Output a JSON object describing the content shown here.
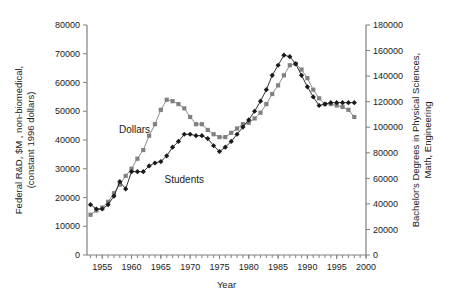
{
  "figure": {
    "background": "#ffffff",
    "axis_color": "#808080",
    "text_color": "#1a1a1a"
  },
  "axes": {
    "x": {
      "label": "Year",
      "ticks": [
        "1955",
        "1960",
        "1965",
        "1970",
        "1975",
        "1980",
        "1985",
        "1990",
        "1995",
        "2000"
      ],
      "tick_values": [
        1955,
        1960,
        1965,
        1970,
        1975,
        1980,
        1985,
        1990,
        1995,
        2000
      ],
      "min": 1952.4,
      "max": 2000,
      "minor_step": 1
    },
    "left": {
      "label_line1": "Federal R&D, $M , non-biomedical,",
      "label_line2": "(constant 1996 dollars)",
      "ticks": [
        "0",
        "10000",
        "20000",
        "30000",
        "40000",
        "50000",
        "60000",
        "70000",
        "80000"
      ],
      "tick_values": [
        0,
        10000,
        20000,
        30000,
        40000,
        50000,
        60000,
        70000,
        80000
      ],
      "min": 0,
      "max": 80000
    },
    "right": {
      "label_line1": "Bachelor's Degrees in Physical Sciences,",
      "label_line2": "Math, Engineering",
      "ticks": [
        "0",
        "20000",
        "40000",
        "60000",
        "80000",
        "100000",
        "120000",
        "140000",
        "160000",
        "180000"
      ],
      "tick_values": [
        0,
        20000,
        40000,
        60000,
        80000,
        100000,
        120000,
        140000,
        160000,
        180000
      ],
      "min": 0,
      "max": 180000
    }
  },
  "series_labels": {
    "dollars": "Dollars",
    "students": "Students"
  },
  "chart_data": {
    "type": "line",
    "title": "",
    "xlabel": "Year",
    "ylabel": "Federal R&D, $M , non-biomedical, (constant 1996 dollars)",
    "y2label": "Bachelor's Degrees in Physical Sciences, Math, Engineering",
    "xlim": [
      1952.4,
      2000
    ],
    "ylim": [
      0,
      80000
    ],
    "y2lim": [
      0,
      180000
    ],
    "grid": false,
    "legend": "inline-annotations",
    "x": [
      1953,
      1954,
      1955,
      1956,
      1957,
      1958,
      1959,
      1960,
      1961,
      1962,
      1963,
      1964,
      1965,
      1966,
      1967,
      1968,
      1969,
      1970,
      1971,
      1972,
      1973,
      1974,
      1975,
      1976,
      1977,
      1978,
      1979,
      1980,
      1981,
      1982,
      1983,
      1984,
      1985,
      1986,
      1987,
      1988,
      1989,
      1990,
      1991,
      1992,
      1993,
      1994,
      1995,
      1996,
      1997,
      1998
    ],
    "series": [
      {
        "name": "Dollars",
        "axis": "left",
        "units": "$M constant 1996 dollars",
        "color": "#808080",
        "marker": "square",
        "values": [
          14000,
          15500,
          16500,
          18500,
          21500,
          24500,
          27500,
          30000,
          33500,
          36500,
          41500,
          45500,
          50500,
          54000,
          53500,
          52500,
          51000,
          48000,
          45500,
          45500,
          43500,
          42000,
          41000,
          41000,
          42500,
          44000,
          45500,
          46000,
          47500,
          49500,
          52500,
          56000,
          59000,
          62500,
          66000,
          66500,
          64500,
          61500,
          57500,
          54500,
          52500,
          52500,
          52000,
          51500,
          50500,
          48000
        ]
      },
      {
        "name": "Students",
        "axis": "right",
        "units": "bachelor's degrees",
        "color": "#1a1a1a",
        "marker": "diamond",
        "values_left_scale": [
          17500,
          16000,
          16000,
          17500,
          20500,
          25500,
          23000,
          29000,
          29000,
          29000,
          31000,
          32000,
          32500,
          34500,
          37500,
          39500,
          42000,
          42000,
          41500,
          41500,
          40500,
          38000,
          36000,
          37500,
          39500,
          42000,
          44500,
          47000,
          50000,
          53500,
          57500,
          62500,
          66000,
          69500,
          69000,
          66500,
          62500,
          58500,
          55000,
          52000,
          52500,
          53000,
          53000,
          53000,
          53000,
          53000
        ],
        "values": [
          39375,
          36000,
          36000,
          39375,
          46125,
          57375,
          51750,
          65250,
          65250,
          65250,
          69750,
          72000,
          73125,
          77625,
          84375,
          88875,
          94500,
          94500,
          93375,
          93375,
          91125,
          85500,
          81000,
          84375,
          88875,
          94500,
          100125,
          105750,
          112500,
          120375,
          129375,
          140625,
          148500,
          156375,
          155250,
          149625,
          140625,
          131625,
          123750,
          117000,
          118125,
          119250,
          119250,
          119250,
          119250,
          119250
        ]
      }
    ],
    "annotations": [
      {
        "text": "Dollars",
        "x": 1960.5,
        "y_left": 42500
      },
      {
        "text": "Students",
        "x": 1969.0,
        "y_left": 25000
      }
    ]
  }
}
